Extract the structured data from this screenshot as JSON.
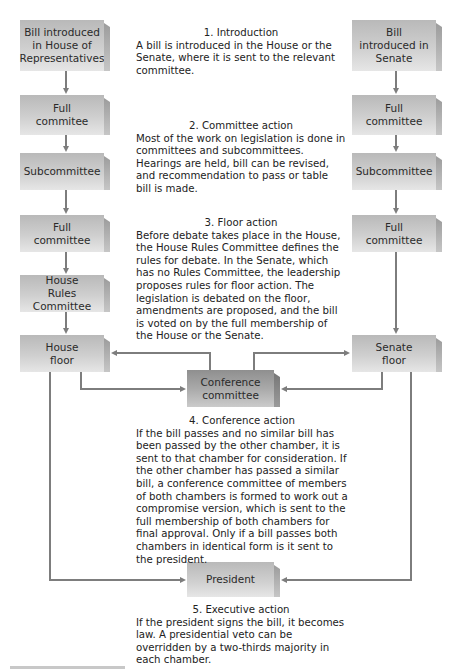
{
  "diagram": {
    "house_column": [
      {
        "label": "Bill introduced in House of Representatives"
      },
      {
        "label": "Full commitee"
      },
      {
        "label": "Subcommittee"
      },
      {
        "label": "Full committee"
      },
      {
        "label": "House Rules Committee"
      },
      {
        "label": "House floor"
      }
    ],
    "senate_column": [
      {
        "label": "Bill introduced in Senate"
      },
      {
        "label": "Full committee"
      },
      {
        "label": "Subcommittee"
      },
      {
        "label": "Full committee"
      },
      {
        "label": "Senate floor"
      }
    ],
    "conference": {
      "label": "Conference committee"
    },
    "president": {
      "label": "President"
    },
    "steps": [
      {
        "heading": "1.  Introduction",
        "body": "A bill is introduced in the House or the Senate, where it is sent to the relevant committee."
      },
      {
        "heading": "2.  Committee action",
        "body": "Most of the work on legislation is done in committees and subcommittees. Hearings are held, bill can be revised, and recommendation to pass or table bill is made."
      },
      {
        "heading": "3.  Floor action",
        "body": "Before debate takes place in the House, the House Rules Committee defines the rules for debate. In the Senate, which has no Rules Committee, the leadership proposes rules for floor action. The legislation is debated on the floor, amendments are proposed, and the bill is voted on by the full membership of the House or the Senate."
      },
      {
        "heading": "4.  Conference action",
        "body": "If the bill passes and no similar bill has been passed by the other chamber, it is sent to that chamber for consideration. If the other chamber has passed a similar bill, a conference committee of members of both chambers is formed to work out a compromise version, which is sent to the full membership of both chambers for final approval. Only if a bill passes both chambers in identical form is it sent to the president."
      },
      {
        "heading": "5.  Executive action",
        "body": "If the president signs the bill, it becomes law. A presidential veto can be overridden by a two-thirds majority in each chamber."
      }
    ],
    "colors": {
      "box": "#cfcfcf",
      "conference_box": "#a9a9a9",
      "connector": "#7d7d7d"
    }
  }
}
